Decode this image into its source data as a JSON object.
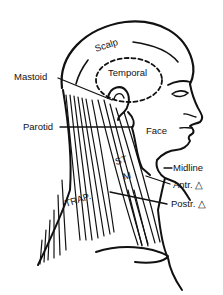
{
  "diagram": {
    "type": "anatomical-illustration",
    "colors": {
      "ink": "#111111",
      "background": "#ffffff"
    },
    "labels": {
      "scalp": "Scalp",
      "temporal": "Temporal",
      "mastoid": "Mastoid",
      "parotid": "Parotid",
      "face": "Face",
      "st": "ST",
      "m": "M",
      "trap": "TRAP.",
      "midline": "Midline",
      "anterior_triangle": "Antr. △",
      "posterior_triangle": "Postr. △"
    }
  }
}
